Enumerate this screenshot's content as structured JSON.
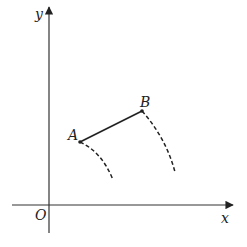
{
  "diagram": {
    "axes": {
      "x_label": "x",
      "y_label": "y",
      "origin_label": "O"
    },
    "points": [
      {
        "name": "A",
        "label": "A"
      },
      {
        "name": "B",
        "label": "B"
      }
    ],
    "segment": "AB",
    "dashed_paths": [
      "path from A (dashed arc)",
      "path from B (dashed arc)"
    ],
    "colors": {
      "ink": "#222222",
      "axis": "#333333"
    }
  }
}
